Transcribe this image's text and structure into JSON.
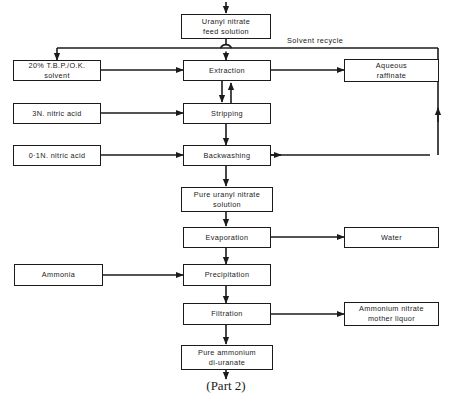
{
  "diagram": {
    "title_caption": "(Part 2)",
    "edge_labels": {
      "solvent_recycle": "Solvent  recycle"
    },
    "nodes": {
      "feed_solution": "Uranyl  nitrate\nfeed  solution",
      "solvent": "20% T.B.P./O.K.\nsolvent",
      "nitric_acid_3n": "3N. nitric  acid",
      "nitric_acid_01n": "0·1N. nitric  acid",
      "extraction": "Extraction",
      "stripping": "Stripping",
      "backwashing": "Backwashing",
      "aqueous_raffinate": "Aqueous\nraffinate",
      "pure_uranyl_nitrate": "Pure  uranyl  nitrate\nsolution",
      "evaporation": "Evaporation",
      "water": "Water",
      "ammonia": "Ammonia",
      "precipitation": "Precipitation",
      "filtration": "Filtration",
      "ammonium_nitrate": "Ammonium   nitrate\nmother liquor",
      "pure_ammonium_diuranate": "Pure  ammonium\ndi-uranate"
    },
    "colors": {
      "line": "#1b1b1b",
      "background": "#ffffff"
    }
  }
}
